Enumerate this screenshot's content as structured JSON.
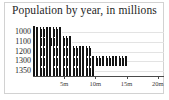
{
  "chart_data": {
    "type": "bar",
    "orientation": "horizontal",
    "title": "Population by year, in millions",
    "xlabel": "",
    "ylabel": "",
    "categories": [
      "1000",
      "1100",
      "1200",
      "1300",
      "1350"
    ],
    "values": [
      4.7,
      6.3,
      9.5,
      15.0,
      10.0
    ],
    "xlim": [
      0,
      21
    ],
    "ylim": [
      0,
      5
    ],
    "x_tick_values": [
      5,
      10,
      15,
      20
    ],
    "x_tick_labels": [
      "5m",
      "10m",
      "15m",
      "20m"
    ],
    "y_tick_labels": [
      "1000",
      "1100",
      "1200",
      "1300",
      "1350"
    ],
    "grid": true,
    "grid_axis": "y",
    "legend": false,
    "legend_position": "none",
    "series": [
      {
        "name": "Population",
        "values": [
          4.7,
          6.3,
          9.5,
          15.0,
          10.0
        ]
      }
    ],
    "marker_style": "person-pictogram",
    "bar_color": "#1a1a1a",
    "grid_color": "#e3e3e3",
    "axis_color": "#4a4a4a",
    "background_color": "#ffffff",
    "title_color": "#262626"
  }
}
